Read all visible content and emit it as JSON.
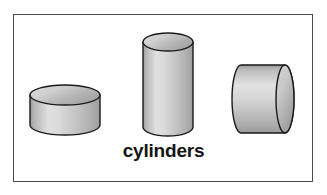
{
  "figure": {
    "label": "cylinders",
    "background_color": "#ffffff",
    "frame": {
      "border_color": "#4a4a4a",
      "fill_color": "#ffffff",
      "x": 13,
      "y": 14,
      "width": 300,
      "height": 168
    },
    "shape_colors": {
      "outline": "#1a1a1a",
      "body_light": "#e2e2e2",
      "body_mid": "#bdbdbd",
      "body_dark": "#9a9a9a",
      "top_face_light": "#dcdcdc",
      "top_face_dark": "#a8a8a8"
    },
    "shapes": [
      {
        "name": "flat-disc-cylinder",
        "orientation": "vertical",
        "description": "short wide cylinder (disc) standing upright",
        "cx": 65,
        "cy": 107,
        "radius_x": 35,
        "radius_y": 10,
        "body_height": 30,
        "top_y": 95,
        "bottom_y": 125
      },
      {
        "name": "tall-cylinder",
        "orientation": "vertical",
        "description": "tall narrow cylinder standing upright",
        "cx": 168,
        "cy": 84,
        "radius_x": 25,
        "radius_y": 9,
        "body_height": 85,
        "top_y": 42,
        "bottom_y": 127
      },
      {
        "name": "horizontal-cylinder",
        "orientation": "horizontal",
        "description": "cylinder lying on its side, circular face visible at right",
        "cy": 99,
        "left_x": 241,
        "right_x": 294,
        "radius_y": 34,
        "radius_x": 9,
        "top_y": 65,
        "bottom_y": 133
      }
    ]
  }
}
